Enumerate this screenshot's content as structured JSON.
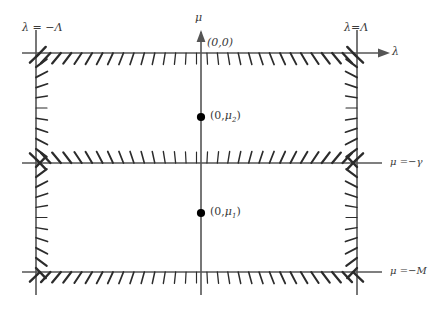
{
  "figure": {
    "background_color": "#ffffff",
    "line_color": "#555555",
    "text_color": "#3a3a3a",
    "dot_color": "#000000"
  },
  "axes": {
    "horizontal_axis_label": "λ",
    "vertical_axis_label": "μ",
    "origin_label": "(0,0)"
  },
  "boundaries": {
    "left_label": "λ = −Λ",
    "right_label": "λ=Λ",
    "middle_right_label": "μ =−γ",
    "bottom_right_label": "μ =−M"
  },
  "points": [
    {
      "name": "upper-point",
      "label_prefix": "(0,",
      "label_symbol": "μ",
      "label_sub": "2",
      "label_suffix": ")"
    },
    {
      "name": "lower-point",
      "label_prefix": "(0,",
      "label_symbol": "μ",
      "label_sub": "1",
      "label_suffix": ")"
    }
  ],
  "geometry": {
    "left_x": 36,
    "right_x": 357,
    "mu_axis_x": 201,
    "top_y": 53,
    "gamma_y": 163,
    "bottom_y": 272,
    "upper_dot_y": 117,
    "lower_dot_y": 213
  }
}
